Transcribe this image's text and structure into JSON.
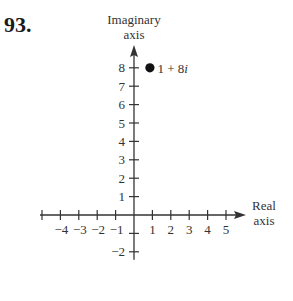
{
  "problem_number": "93.",
  "chart_data": {
    "type": "scatter",
    "title": "",
    "xlabel": "Real axis",
    "ylabel": "Imaginary axis",
    "xlabel_lines": [
      "Real",
      "axis"
    ],
    "ylabel_lines": [
      "Imaginary",
      "axis"
    ],
    "x_ticks": [
      -4,
      -3,
      -2,
      -1,
      1,
      2,
      3,
      4,
      5
    ],
    "x_tick_labels": [
      "−4",
      "−3",
      "−2",
      "−1",
      "1",
      "2",
      "3",
      "4",
      "5"
    ],
    "y_ticks": [
      -2,
      1,
      2,
      3,
      4,
      5,
      6,
      7,
      8
    ],
    "y_tick_labels": [
      "−2",
      "1",
      "2",
      "3",
      "4",
      "5",
      "6",
      "7",
      "8"
    ],
    "xlim": [
      -5,
      6
    ],
    "ylim": [
      -2,
      9
    ],
    "grid": false,
    "points": [
      {
        "x": 1,
        "y": 8,
        "label": "1 + 8i",
        "label_real": "1 + 8",
        "label_imag": "i"
      }
    ],
    "colors": {
      "axis": "#333333",
      "point": "#111111"
    }
  }
}
